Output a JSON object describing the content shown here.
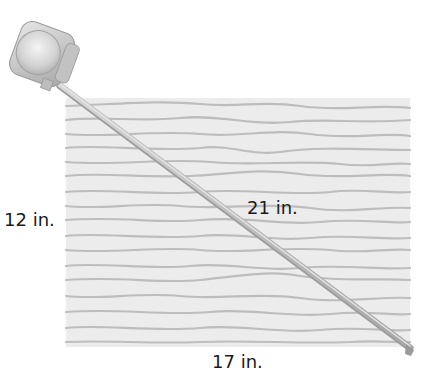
{
  "figure": {
    "type": "tape-measure-diagonal-of-rectangular-board",
    "labels": {
      "height": "12 in.",
      "diagonal": "21 in.",
      "width": "17 in."
    },
    "colors": {
      "board_fill": "#ececec",
      "grain_line": "#b8b8b8",
      "tape": "#c4c4c4",
      "housing_light": "#e2e2e2",
      "housing_dark": "#a9a9a9",
      "text": "#1a1a1a"
    }
  }
}
